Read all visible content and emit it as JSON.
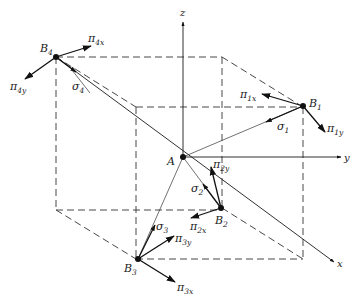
{
  "figure": {
    "axes": [
      {
        "name": "x",
        "label": "x"
      },
      {
        "name": "y",
        "label": "y"
      },
      {
        "name": "z",
        "label": "z"
      }
    ],
    "origin": {
      "label": "A"
    },
    "nodes": [
      {
        "id": "B1",
        "label": "B",
        "sub": "1",
        "member_force": {
          "label": "σ",
          "sub": "1"
        },
        "loads": [
          {
            "label": "π",
            "sub": "1x"
          },
          {
            "label": "π",
            "sub": "1y"
          }
        ]
      },
      {
        "id": "B2",
        "label": "B",
        "sub": "2",
        "member_force": {
          "label": "σ",
          "sub": "2"
        },
        "loads": [
          {
            "label": "π",
            "sub": "2x"
          },
          {
            "label": "π",
            "sub": "2y"
          }
        ]
      },
      {
        "id": "B3",
        "label": "B",
        "sub": "3",
        "member_force": {
          "label": "σ",
          "sub": "3"
        },
        "loads": [
          {
            "label": "π",
            "sub": "3x"
          },
          {
            "label": "π",
            "sub": "3y"
          }
        ]
      },
      {
        "id": "B4",
        "label": "B",
        "sub": "4",
        "member_force": {
          "label": "σ",
          "sub": "4"
        },
        "loads": [
          {
            "label": "π",
            "sub": "4x"
          },
          {
            "label": "π",
            "sub": "4y"
          }
        ]
      }
    ]
  }
}
